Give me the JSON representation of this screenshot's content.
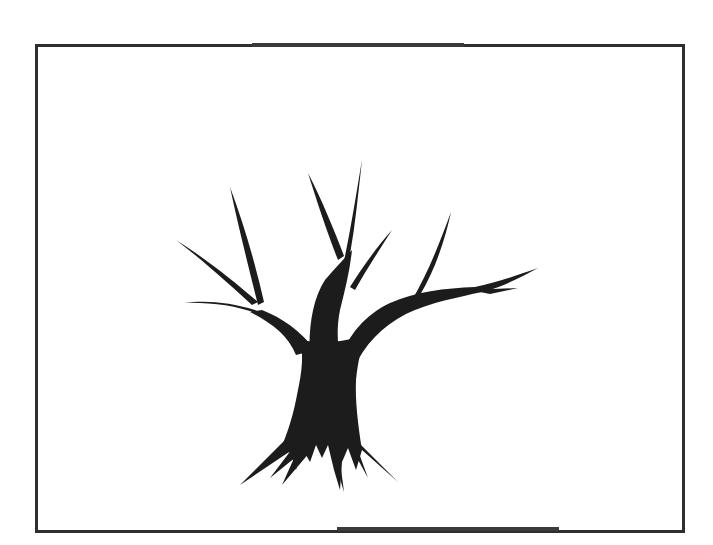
{
  "image": {
    "subject": "tree-silhouette",
    "description": "Black silhouette of a bare tree with spiky branches and roots inside a rectangular black frame",
    "colors": {
      "background": "#ffffff",
      "frame": "#2e2e2e",
      "tree": "#1c1c1c"
    },
    "frame": {
      "left": 35,
      "top": 44,
      "right": 682,
      "bottom": 530
    }
  }
}
